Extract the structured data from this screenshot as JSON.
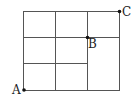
{
  "diagram": {
    "type": "grid-path",
    "grid": {
      "columns": 3,
      "rows": 3,
      "stroke_color": "#555555",
      "note": "lower interior horizontal line spans only the first two columns"
    },
    "points": [
      {
        "label": "A",
        "position": "bottom-left corner"
      },
      {
        "label": "B",
        "position": "interior node at column 2, row 1 line"
      },
      {
        "label": "C",
        "position": "top-right corner"
      }
    ]
  }
}
